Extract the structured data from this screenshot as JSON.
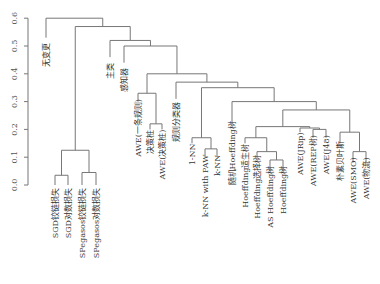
{
  "chart_data": {
    "type": "dendrogram",
    "title": "",
    "xlabel": "",
    "ylabel": "",
    "ylim": [
      0.0,
      0.65
    ],
    "y_ticks": [
      "0.0",
      "0.1",
      "0.2",
      "0.3",
      "0.4",
      "0.5",
      "0.6"
    ],
    "leaves": [
      {
        "label": "无变更",
        "x": 46
      },
      {
        "label": "SGD铰链损失",
        "x": 55
      },
      {
        "label": "SGD对数损失",
        "x": 68
      },
      {
        "label": "SPegasos铰链损失",
        "x": 82
      },
      {
        "label": "SPegasos对数损失",
        "x": 96
      },
      {
        "label": "主类",
        "x": 110
      },
      {
        "label": "感知器",
        "x": 124
      },
      {
        "label": "AWE(一条规则)",
        "x": 138
      },
      {
        "label": "决策桩",
        "x": 150
      },
      {
        "label": "AWE(决策桩)",
        "x": 162
      },
      {
        "label": "规则分类器",
        "x": 176
      },
      {
        "label": "1-NN",
        "x": 192
      },
      {
        "label": "k-NN with PAW",
        "x": 205
      },
      {
        "label": "k-NN",
        "x": 217
      },
      {
        "label": "随机Hoeffding树",
        "x": 232
      },
      {
        "label": "Hoeffding适生树",
        "x": 245
      },
      {
        "label": "Hoeffding选择树",
        "x": 257
      },
      {
        "label": "AS Hoeffding树",
        "x": 270
      },
      {
        "label": "Hoeffding树",
        "x": 283
      },
      {
        "label": "AWE(JRip)",
        "x": 300
      },
      {
        "label": "AWE(REP树)",
        "x": 313
      },
      {
        "label": "AWE(J48)",
        "x": 326
      },
      {
        "label": "朴素贝叶斯",
        "x": 340
      },
      {
        "label": "AWE(SMO)",
        "x": 353
      },
      {
        "label": "AWE(物流)",
        "x": 366
      }
    ],
    "leaf_heights": {
      "无变更": 0.53,
      "SGD铰链损失": 0.035,
      "SGD对数损失": 0.035,
      "SPegasos铰链损失": 0.045,
      "SPegasos对数损失": 0.045,
      "主类": 0.46,
      "感知器": 0.44,
      "AWE(一条规则)": 0.33,
      "决策桩": 0.22,
      "AWE(决策桩)": 0.22,
      "规则分类器": 0.32,
      "1-NN": 0.17,
      "k-NN with PAW": 0.13,
      "k-NN": 0.13,
      "随机Hoeffding树": 0.25,
      "Hoeffding适生树": 0.17,
      "Hoeffding选择树": 0.13,
      "AS Hoeffding树": 0.09,
      "Hoeffding树": 0.09,
      "AWE(JRip)": 0.21,
      "AWE(REP树)": 0.2,
      "AWE(J48)": 0.2,
      "朴素贝叶斯": 0.18,
      "AWE(SMO)": 0.12,
      "AWE(物流)": 0.12
    }
  }
}
